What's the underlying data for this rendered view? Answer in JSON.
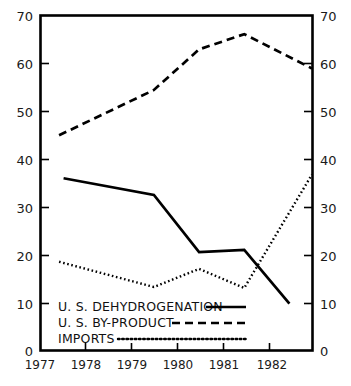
{
  "chart_data": {
    "type": "line",
    "title": "",
    "subtitle": "",
    "xlabel": "",
    "ylabel": "",
    "xlim": [
      1977.0,
      1983.0
    ],
    "ylim": [
      0,
      70
    ],
    "grid": false,
    "legend_position": "inside-bottom-left",
    "x_tick_labels": [
      "1977",
      "1978",
      "1979",
      "1980",
      "1981",
      "1982"
    ],
    "x_tick_values": [
      1977,
      1978,
      1979,
      1980,
      1981,
      1982
    ],
    "y_tick_labels_left": [
      "0",
      "10",
      "20",
      "30",
      "40",
      "50",
      "60",
      "70"
    ],
    "y_tick_labels_right": [
      "0",
      "10",
      "20",
      "30",
      "40",
      "50",
      "60",
      "70"
    ],
    "y_tick_values": [
      0,
      10,
      20,
      30,
      40,
      50,
      60,
      70
    ],
    "dual_y_axis": true,
    "series": [
      {
        "name": "U. S.  DEHYDROGENATION",
        "style": "solid",
        "color": "#000000",
        "x": [
          1977.5,
          1979.5,
          1980.5,
          1981.5,
          1982.5
        ],
        "values": [
          36.0,
          32.5,
          20.5,
          21.0,
          9.7
        ]
      },
      {
        "name": "U. S.  BY-PRODUCT",
        "style": "dashed",
        "color": "#000000",
        "x": [
          1977.4,
          1979.5,
          1980.5,
          1981.5,
          1983.0
        ],
        "values": [
          45.0,
          54.5,
          63.0,
          66.2,
          59.0
        ]
      },
      {
        "name": "IMPORTS",
        "style": "dotted",
        "color": "#000000",
        "x": [
          1977.4,
          1979.5,
          1980.5,
          1981.5,
          1983.0
        ],
        "values": [
          18.5,
          13.2,
          17.0,
          13.0,
          36.8
        ]
      }
    ]
  },
  "axes": {
    "left": {
      "name": "left-value-axis",
      "ticks": [
        "70",
        "60",
        "50",
        "40",
        "30",
        "20",
        "10",
        "0"
      ]
    },
    "right": {
      "name": "right-value-axis",
      "ticks": [
        "70",
        "60",
        "50",
        "40",
        "30",
        "20",
        "10",
        "0"
      ]
    },
    "bottom": {
      "name": "year-axis",
      "ticks": [
        "1977",
        "1978",
        "1979",
        "1980",
        "1981",
        "1982"
      ]
    }
  },
  "legend": {
    "entries": [
      {
        "label": "U. S.  DEHYDROGENATION",
        "style": "solid"
      },
      {
        "label": "U. S.  BY-PRODUCT",
        "style": "dashed"
      },
      {
        "label": "IMPORTS",
        "style": "dotted"
      }
    ]
  },
  "colors": {
    "ink": "#000000",
    "background": "#ffffff"
  }
}
